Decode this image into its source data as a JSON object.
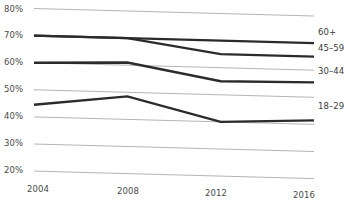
{
  "chart_data": {
    "type": "line",
    "title": "",
    "subtitle": "",
    "xlabel": "",
    "ylabel": "",
    "x": [
      2004,
      2008,
      2012,
      2016
    ],
    "categories": [
      "2004",
      "2008",
      "2012",
      "2016"
    ],
    "xtick_labels": [
      "2004",
      "2008",
      "2012",
      "2016"
    ],
    "ytick_labels": [
      "80%",
      "70%",
      "60%",
      "50%",
      "40%",
      "30%",
      "20%"
    ],
    "ytick_values": [
      80,
      70,
      60,
      50,
      40,
      30,
      20
    ],
    "ylim": [
      20,
      80
    ],
    "xlim": [
      2004,
      2016
    ],
    "grid": true,
    "grid_axis": "y",
    "legend_position": "right-inline",
    "series": [
      {
        "name": "60+",
        "label": "60+",
        "values": [
          70,
          70,
          70,
          70
        ],
        "color": "#2b2b2b"
      },
      {
        "name": "45-59",
        "label": "45–59",
        "values": [
          70,
          70,
          65,
          65
        ],
        "color": "#2b2b2b"
      },
      {
        "name": "30-44",
        "label": "30–44",
        "values": [
          60,
          61,
          55,
          55.5
        ],
        "color": "#2b2b2b"
      },
      {
        "name": "18-29",
        "label": "18–29",
        "values": [
          44.5,
          48.5,
          40,
          41.5
        ],
        "color": "#2b2b2b"
      }
    ],
    "colors": {
      "line": "#2b2b2b",
      "gridline": "#b5b5b5",
      "text": "#4a4a4a",
      "background": "#ffffff"
    }
  }
}
